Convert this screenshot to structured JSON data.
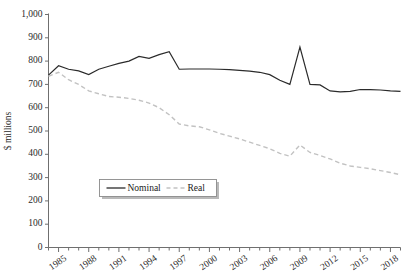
{
  "chart_data": {
    "type": "line",
    "title": "",
    "xlabel": "",
    "ylabel": "$ millions",
    "ylim": [
      0,
      1000
    ],
    "ytick_values": [
      0,
      100,
      200,
      300,
      400,
      500,
      600,
      700,
      800,
      900,
      1000
    ],
    "ytick_labels": [
      "0",
      "100",
      "200",
      "300",
      "400",
      "500",
      "600",
      "700",
      "800",
      "900",
      "1,000"
    ],
    "xlim": [
      1984,
      2019
    ],
    "x": [
      1984,
      1985,
      1986,
      1987,
      1988,
      1989,
      1990,
      1991,
      1992,
      1993,
      1994,
      1995,
      1996,
      1997,
      1998,
      1999,
      2000,
      2001,
      2002,
      2003,
      2004,
      2005,
      2006,
      2007,
      2008,
      2009,
      2010,
      2011,
      2012,
      2013,
      2014,
      2015,
      2016,
      2017,
      2018,
      2019
    ],
    "xtick_values": [
      1984,
      1985,
      1986,
      1987,
      1988,
      1989,
      1990,
      1991,
      1992,
      1993,
      1994,
      1995,
      1996,
      1997,
      1998,
      1999,
      2000,
      2001,
      2002,
      2003,
      2004,
      2005,
      2006,
      2007,
      2008,
      2009,
      2010,
      2011,
      2012,
      2013,
      2014,
      2015,
      2016,
      2017,
      2018,
      2019
    ],
    "xtick_labeled": [
      1985,
      1988,
      1991,
      1994,
      1997,
      2000,
      2003,
      2006,
      2009,
      2012,
      2015,
      2018
    ],
    "xtick_labels": [
      "1985",
      "1988",
      "1991",
      "1994",
      "1997",
      "2000",
      "2003",
      "2006",
      "2009",
      "2012",
      "2015",
      "2018"
    ],
    "grid": false,
    "legend_position": "center-left",
    "series": [
      {
        "name": "Nominal",
        "style": "solid",
        "color": "#2b2b2b",
        "values": [
          740,
          780,
          765,
          758,
          742,
          765,
          778,
          790,
          800,
          820,
          812,
          828,
          840,
          765,
          766,
          766,
          766,
          765,
          763,
          760,
          757,
          752,
          742,
          718,
          700,
          860,
          700,
          698,
          672,
          668,
          670,
          678,
          678,
          676,
          672,
          670
        ]
      },
      {
        "name": "Real",
        "style": "dashed",
        "color": "#c2c2c2",
        "values": [
          735,
          752,
          720,
          700,
          672,
          660,
          648,
          645,
          640,
          632,
          620,
          600,
          570,
          530,
          522,
          518,
          505,
          490,
          478,
          466,
          452,
          438,
          424,
          404,
          392,
          440,
          408,
          395,
          380,
          362,
          350,
          344,
          338,
          330,
          322,
          312
        ]
      }
    ],
    "legend": [
      {
        "label": "Nominal",
        "style": "solid",
        "color": "#2b2b2b"
      },
      {
        "label": "Real",
        "style": "dashed",
        "color": "#c2c2c2"
      }
    ]
  }
}
